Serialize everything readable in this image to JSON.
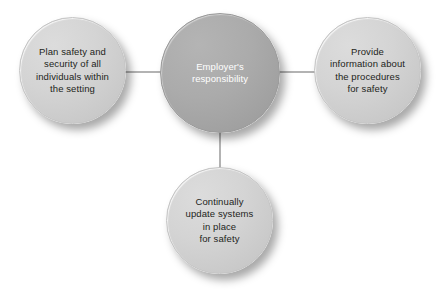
{
  "diagram": {
    "type": "hub-and-spoke",
    "title": "Employer's responsibility",
    "background_color": "#ffffff",
    "hub": {
      "id": "employer-responsibility",
      "label": "Employer's\nresponsibility",
      "fill_color": "#a8a8a8",
      "text_color": "#ffffff"
    },
    "satellites": [
      {
        "id": "plan-safety",
        "position": "left",
        "label": "Plan safety and\nsecurity of all\nindividuals within\nthe setting",
        "fill_color": "#d4d4d4",
        "text_color": "#231f20"
      },
      {
        "id": "provide-information",
        "position": "right",
        "label": "Provide\ninformation about\nthe procedures\nfor safety",
        "fill_color": "#d4d4d4",
        "text_color": "#231f20"
      },
      {
        "id": "update-systems",
        "position": "bottom",
        "label": "Continually\nupdate systems\nin place\nfor safety",
        "fill_color": "#d4d4d4",
        "text_color": "#231f20"
      }
    ],
    "connectors": [
      {
        "id": "hub-to-plan-safety",
        "from": "employer-responsibility",
        "to": "plan-safety",
        "color": "#b3b3b3"
      },
      {
        "id": "hub-to-provide-info",
        "from": "employer-responsibility",
        "to": "provide-information",
        "color": "#b3b3b3"
      },
      {
        "id": "hub-to-update-systems",
        "from": "employer-responsibility",
        "to": "update-systems",
        "color": "#b3b3b3"
      }
    ]
  }
}
